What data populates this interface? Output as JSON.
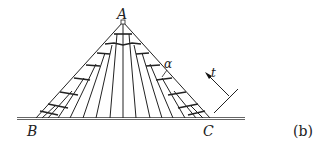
{
  "figure": {
    "panel_label": "(b)",
    "labels": {
      "apex": "A",
      "base_left": "B",
      "base_right": "C",
      "angle": "α",
      "direction": "t"
    },
    "geometry": {
      "apex": [
        123,
        22
      ],
      "base_left": [
        37,
        118
      ],
      "base_right": [
        209,
        118
      ],
      "ground_y": 118,
      "ground_x": [
        17,
        245
      ]
    }
  }
}
